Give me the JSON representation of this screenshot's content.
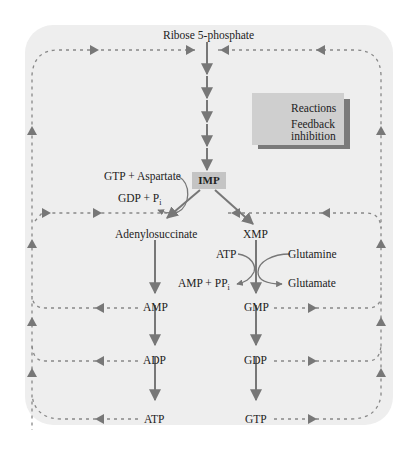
{
  "diagram": {
    "title_node": "Ribose 5-phosphate",
    "nodes": {
      "imp": "IMP",
      "adenylosuccinate": "Adenylosuccinate",
      "xmp": "XMP",
      "amp": "AMP",
      "adp": "ADP",
      "atp": "ATP",
      "gmp": "GMP",
      "gdp": "GDP",
      "gtp": "GTP"
    },
    "side_reactants": {
      "gtp_aspartate": "GTP + Aspartate",
      "gdp_pi": "GDP + P",
      "gdp_pi_sub": "i",
      "atp": "ATP",
      "amp_ppi": "AMP + PP",
      "amp_ppi_sub": "i",
      "glutamine": "Glutamine",
      "glutamate": "Glutamate"
    },
    "legend": {
      "reactions": "Reactions",
      "feedback_line1": "Feedback",
      "feedback_line2": "inhibition"
    },
    "colors": {
      "panel": "#eeeeee",
      "arrow": "#777777",
      "dashed": "#888888",
      "imp_box": "#c4c4c4",
      "legend_box": "#cfcfcf",
      "legend_shadow": "#7a7a7a"
    }
  }
}
